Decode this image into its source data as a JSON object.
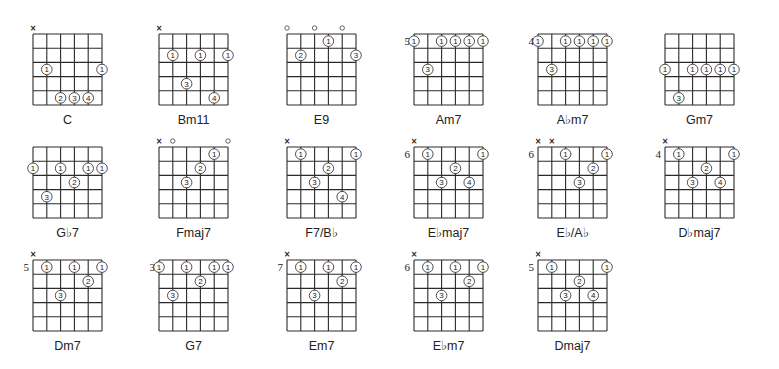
{
  "strings": 6,
  "frets_shown": 5,
  "chords": [
    {
      "name": "C",
      "base_fret": null,
      "muted": [
        1
      ],
      "open": [],
      "fingers": [
        {
          "string": 2,
          "fret": 3,
          "finger": "1"
        },
        {
          "string": 6,
          "fret": 3,
          "finger": "1"
        },
        {
          "string": 3,
          "fret": 5,
          "finger": "2"
        },
        {
          "string": 4,
          "fret": 5,
          "finger": "3"
        },
        {
          "string": 5,
          "fret": 5,
          "finger": "4"
        }
      ]
    },
    {
      "name": "Bm11",
      "base_fret": null,
      "muted": [
        1
      ],
      "open": [],
      "fingers": [
        {
          "string": 2,
          "fret": 2,
          "finger": "1"
        },
        {
          "string": 4,
          "fret": 2,
          "finger": "1"
        },
        {
          "string": 6,
          "fret": 2,
          "finger": "1"
        },
        {
          "string": 3,
          "fret": 4,
          "finger": "3"
        },
        {
          "string": 5,
          "fret": 5,
          "finger": "4"
        }
      ]
    },
    {
      "name": "E9",
      "base_fret": null,
      "muted": [],
      "open": [
        1,
        3,
        5
      ],
      "fingers": [
        {
          "string": 4,
          "fret": 1,
          "finger": "1"
        },
        {
          "string": 2,
          "fret": 2,
          "finger": "2"
        },
        {
          "string": 6,
          "fret": 2,
          "finger": "3"
        }
      ]
    },
    {
      "name": "Am7",
      "base_fret": "5",
      "muted": [],
      "open": [],
      "fingers": [
        {
          "string": 1,
          "fret": 1,
          "finger": "1"
        },
        {
          "string": 3,
          "fret": 1,
          "finger": "1"
        },
        {
          "string": 4,
          "fret": 1,
          "finger": "1"
        },
        {
          "string": 5,
          "fret": 1,
          "finger": "1"
        },
        {
          "string": 6,
          "fret": 1,
          "finger": "1"
        },
        {
          "string": 2,
          "fret": 3,
          "finger": "3"
        }
      ]
    },
    {
      "name": "A♭m7",
      "base_fret": "4",
      "muted": [],
      "open": [],
      "fingers": [
        {
          "string": 1,
          "fret": 1,
          "finger": "1"
        },
        {
          "string": 3,
          "fret": 1,
          "finger": "1"
        },
        {
          "string": 4,
          "fret": 1,
          "finger": "1"
        },
        {
          "string": 5,
          "fret": 1,
          "finger": "1"
        },
        {
          "string": 6,
          "fret": 1,
          "finger": "1"
        },
        {
          "string": 2,
          "fret": 3,
          "finger": "3"
        }
      ]
    },
    {
      "name": "Gm7",
      "base_fret": null,
      "muted": [],
      "open": [],
      "fingers": [
        {
          "string": 1,
          "fret": 3,
          "finger": "1"
        },
        {
          "string": 3,
          "fret": 3,
          "finger": "1"
        },
        {
          "string": 4,
          "fret": 3,
          "finger": "1"
        },
        {
          "string": 5,
          "fret": 3,
          "finger": "1"
        },
        {
          "string": 6,
          "fret": 3,
          "finger": "1"
        },
        {
          "string": 2,
          "fret": 5,
          "finger": "3"
        }
      ]
    },
    {
      "name": "G♭7",
      "base_fret": null,
      "muted": [],
      "open": [],
      "fingers": [
        {
          "string": 1,
          "fret": 2,
          "finger": "1"
        },
        {
          "string": 3,
          "fret": 2,
          "finger": "1"
        },
        {
          "string": 5,
          "fret": 2,
          "finger": "1"
        },
        {
          "string": 6,
          "fret": 2,
          "finger": "1"
        },
        {
          "string": 4,
          "fret": 3,
          "finger": "2"
        },
        {
          "string": 2,
          "fret": 4,
          "finger": "3"
        }
      ]
    },
    {
      "name": "Fmaj7",
      "base_fret": null,
      "muted": [
        1
      ],
      "open": [
        2,
        6
      ],
      "fingers": [
        {
          "string": 5,
          "fret": 1,
          "finger": "1"
        },
        {
          "string": 4,
          "fret": 2,
          "finger": "2"
        },
        {
          "string": 3,
          "fret": 3,
          "finger": "3"
        }
      ]
    },
    {
      "name": "F7/B♭",
      "base_fret": null,
      "muted": [
        1
      ],
      "open": [],
      "fingers": [
        {
          "string": 2,
          "fret": 1,
          "finger": "1"
        },
        {
          "string": 6,
          "fret": 1,
          "finger": "1"
        },
        {
          "string": 4,
          "fret": 2,
          "finger": "2"
        },
        {
          "string": 3,
          "fret": 3,
          "finger": "3"
        },
        {
          "string": 5,
          "fret": 4,
          "finger": "4"
        }
      ]
    },
    {
      "name": "E♭maj7",
      "base_fret": "6",
      "muted": [
        1
      ],
      "open": [],
      "fingers": [
        {
          "string": 2,
          "fret": 1,
          "finger": "1"
        },
        {
          "string": 6,
          "fret": 1,
          "finger": "1"
        },
        {
          "string": 4,
          "fret": 2,
          "finger": "2"
        },
        {
          "string": 3,
          "fret": 3,
          "finger": "3"
        },
        {
          "string": 5,
          "fret": 3,
          "finger": "4"
        }
      ]
    },
    {
      "name": "E♭/A♭",
      "base_fret": "6",
      "muted": [
        1,
        2
      ],
      "open": [],
      "fingers": [
        {
          "string": 3,
          "fret": 1,
          "finger": "1"
        },
        {
          "string": 6,
          "fret": 1,
          "finger": "1"
        },
        {
          "string": 5,
          "fret": 2,
          "finger": "2"
        },
        {
          "string": 4,
          "fret": 3,
          "finger": "3"
        }
      ]
    },
    {
      "name": "D♭maj7",
      "base_fret": "4",
      "muted": [
        1
      ],
      "open": [],
      "fingers": [
        {
          "string": 2,
          "fret": 1,
          "finger": "1"
        },
        {
          "string": 6,
          "fret": 1,
          "finger": "1"
        },
        {
          "string": 4,
          "fret": 2,
          "finger": "2"
        },
        {
          "string": 3,
          "fret": 3,
          "finger": "3"
        },
        {
          "string": 5,
          "fret": 3,
          "finger": "4"
        }
      ]
    },
    {
      "name": "Dm7",
      "base_fret": "5",
      "muted": [
        1
      ],
      "open": [],
      "fingers": [
        {
          "string": 2,
          "fret": 1,
          "finger": "1"
        },
        {
          "string": 4,
          "fret": 1,
          "finger": "1"
        },
        {
          "string": 6,
          "fret": 1,
          "finger": "1"
        },
        {
          "string": 5,
          "fret": 2,
          "finger": "2"
        },
        {
          "string": 3,
          "fret": 3,
          "finger": "3"
        }
      ]
    },
    {
      "name": "G7",
      "base_fret": "3",
      "muted": [],
      "open": [],
      "fingers": [
        {
          "string": 1,
          "fret": 1,
          "finger": "1"
        },
        {
          "string": 3,
          "fret": 1,
          "finger": "1"
        },
        {
          "string": 5,
          "fret": 1,
          "finger": "1"
        },
        {
          "string": 6,
          "fret": 1,
          "finger": "1"
        },
        {
          "string": 4,
          "fret": 2,
          "finger": "2"
        },
        {
          "string": 2,
          "fret": 3,
          "finger": "3"
        }
      ]
    },
    {
      "name": "Em7",
      "base_fret": "7",
      "muted": [
        1
      ],
      "open": [],
      "fingers": [
        {
          "string": 2,
          "fret": 1,
          "finger": "1"
        },
        {
          "string": 4,
          "fret": 1,
          "finger": "1"
        },
        {
          "string": 6,
          "fret": 1,
          "finger": "1"
        },
        {
          "string": 5,
          "fret": 2,
          "finger": "2"
        },
        {
          "string": 3,
          "fret": 3,
          "finger": "3"
        }
      ]
    },
    {
      "name": "E♭m7",
      "base_fret": "6",
      "muted": [
        1
      ],
      "open": [],
      "fingers": [
        {
          "string": 2,
          "fret": 1,
          "finger": "1"
        },
        {
          "string": 4,
          "fret": 1,
          "finger": "1"
        },
        {
          "string": 6,
          "fret": 1,
          "finger": "1"
        },
        {
          "string": 5,
          "fret": 2,
          "finger": "2"
        },
        {
          "string": 3,
          "fret": 3,
          "finger": "3"
        }
      ]
    },
    {
      "name": "Dmaj7",
      "base_fret": "5",
      "muted": [
        1
      ],
      "open": [],
      "fingers": [
        {
          "string": 2,
          "fret": 1,
          "finger": "1"
        },
        {
          "string": 6,
          "fret": 1,
          "finger": "1"
        },
        {
          "string": 4,
          "fret": 2,
          "finger": "2"
        },
        {
          "string": 3,
          "fret": 3,
          "finger": "3"
        },
        {
          "string": 5,
          "fret": 3,
          "finger": "4"
        }
      ]
    }
  ],
  "symbols": {
    "muted": "×",
    "open": "○"
  }
}
